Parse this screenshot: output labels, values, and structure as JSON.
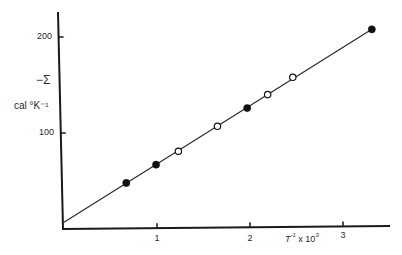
{
  "chart_data": {
    "type": "scatter",
    "title": "",
    "xlabel": "T⁻¹ x 10³",
    "ylabel": "−Σ cal °K⁻¹",
    "ylabel_symbol": "−Σ",
    "ylabel_unit": "cal °K⁻¹",
    "xlabel_main": "T",
    "xlabel_sup": "-1",
    "xlabel_rest": "x 10",
    "xlabel_sup2": "3",
    "xlim": [
      0,
      3.5
    ],
    "ylim": [
      0,
      225
    ],
    "x_ticks": [
      1,
      2,
      3
    ],
    "x_tick_labels": [
      "1",
      "2",
      "3"
    ],
    "y_ticks": [
      100,
      200
    ],
    "y_tick_labels": [
      "100",
      "200"
    ],
    "grid": false,
    "legend": null,
    "series": [
      {
        "name": "filled circles",
        "marker": "filled-circle",
        "x": [
          0.67,
          0.99,
          1.97,
          3.31
        ],
        "y": [
          48,
          67,
          126,
          208
        ]
      },
      {
        "name": "open circles",
        "marker": "open-circle",
        "x": [
          1.23,
          1.65,
          2.19,
          2.46
        ],
        "y": [
          81,
          107,
          140,
          158
        ]
      }
    ],
    "fit_line": {
      "type": "linear",
      "x": [
        0,
        3.31
      ],
      "y": [
        7,
        208
      ]
    }
  },
  "colors": {
    "axis": "#1a1a1a",
    "line": "#2a2a2a",
    "marker_fill": "#111111",
    "background": "#ffffff"
  }
}
